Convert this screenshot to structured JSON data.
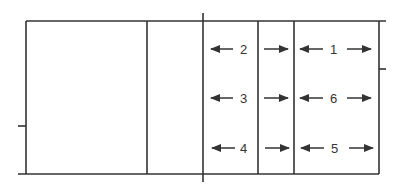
{
  "diagram": {
    "type": "volleyball-court-positions",
    "colors": {
      "line": "#333333",
      "background": "#ffffff"
    },
    "positions": [
      {
        "label": "2",
        "row": 0,
        "zone": "front",
        "arrows": [
          "left",
          "right"
        ]
      },
      {
        "label": "3",
        "row": 1,
        "zone": "front",
        "arrows": [
          "left",
          "right"
        ]
      },
      {
        "label": "4",
        "row": 2,
        "zone": "front",
        "arrows": [
          "left",
          "right"
        ]
      },
      {
        "label": "1",
        "row": 0,
        "zone": "back",
        "arrows": [
          "left",
          "right"
        ]
      },
      {
        "label": "6",
        "row": 1,
        "zone": "back",
        "arrows": [
          "left",
          "right"
        ]
      },
      {
        "label": "5",
        "row": 2,
        "zone": "back",
        "arrows": [
          "left",
          "right"
        ]
      }
    ]
  }
}
